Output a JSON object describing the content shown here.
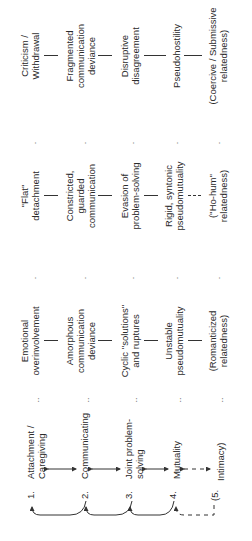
{
  "stages": [
    {
      "number": "1.",
      "label_line1": "Attachment /",
      "label_line2": "Caregiving"
    },
    {
      "number": "2.",
      "label_line1": "Communicating",
      "label_line2": ""
    },
    {
      "number": "3.",
      "label_line1": "Joint problem-",
      "label_line2": "solving"
    },
    {
      "number": "4.",
      "label_line1": "Mutuality",
      "label_line2": ""
    },
    {
      "number": "(5.",
      "label_line1": "Intimacy)",
      "label_line2": ""
    }
  ],
  "columns": [
    {
      "marker": "..",
      "items": [
        {
          "line1": "Emotional",
          "line2": "overinvolvement",
          "line3": ""
        },
        {
          "line1": "Amorphous",
          "line2": "communication",
          "line3": "deviance"
        },
        {
          "line1": "Cyclic ''solutions''",
          "line2": "and ruptures",
          "line3": ""
        },
        {
          "line1": "Unstable",
          "line2": "pseudomutuality",
          "line3": ""
        },
        {
          "line1": "(Romanticized",
          "line2": "relatedness)",
          "line3": ""
        }
      ]
    },
    {
      "marker": ".",
      "items": [
        {
          "line1": "''Flat''",
          "line2": "detachment",
          "line3": ""
        },
        {
          "line1": "Constricted,",
          "line2": "guarded",
          "line3": "communication"
        },
        {
          "line1": "Evasion of",
          "line2": "problem-solving",
          "line3": ""
        },
        {
          "line1": "Rigid, syntonic",
          "line2": "pseudomutuality",
          "line3": ""
        },
        {
          "line1": "(''Ho-hum''",
          "line2": "relatedness)",
          "line3": ""
        }
      ]
    },
    {
      "marker": ".",
      "items": [
        {
          "line1": "Criticism /",
          "line2": "Withdrawal",
          "line3": ""
        },
        {
          "line1": "Fragmented",
          "line2": "communication",
          "line3": "deviance"
        },
        {
          "line1": "Disruptive",
          "line2": "disagreement",
          "line3": ""
        },
        {
          "line1": "Pseudohostility",
          "line2": "",
          "line3": ""
        },
        {
          "line1": "(Coercive / Submissive",
          "line2": "relatedness)",
          "line3": ""
        }
      ]
    }
  ],
  "colors": {
    "ink": "#2a2a2a",
    "background": "#ffffff"
  }
}
